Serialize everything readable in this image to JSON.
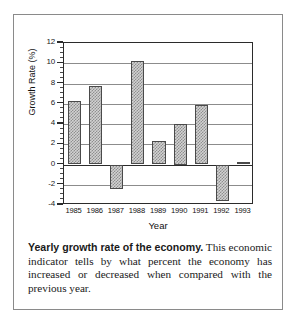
{
  "figure": {
    "caption_lead": "Yearly growth rate of the economy.",
    "caption_body": " This economic indicator tells by what percent the economy has increased or decreased when compared with the previous year."
  },
  "chart_data": {
    "type": "bar",
    "title": "",
    "xlabel": "Year",
    "ylabel": "Growth Rate (%)",
    "categories": [
      "1985",
      "1986",
      "1987",
      "1988",
      "1989",
      "1990",
      "1991",
      "1992",
      "1993"
    ],
    "values": [
      6.3,
      7.8,
      -2.4,
      10.2,
      2.3,
      4.0,
      5.9,
      -3.6,
      0.2
    ],
    "ylim": [
      -4,
      12
    ],
    "yticks": [
      12,
      10,
      8,
      6,
      4,
      2,
      0,
      -2,
      -4
    ],
    "ytick_labels": [
      "12",
      "10",
      "8",
      "6",
      "4",
      "2",
      "0",
      "-2",
      "-4"
    ],
    "minor_tick_step": 0.5,
    "grid": true,
    "grid_axis": "y",
    "legend": "none",
    "bar_fill": "#d2d2d2",
    "bar_hatch": "crosshatch",
    "bar_edge_color": "#4a4a4a",
    "axis_color": "#2b2b2b",
    "grid_color": "#8c8c8c",
    "background": "#ffffff"
  }
}
